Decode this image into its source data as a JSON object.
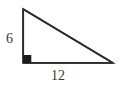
{
  "figure": {
    "type": "right-triangle-diagram",
    "background_color": "#ffffff",
    "stroke_color": "#2b2b2b",
    "label_color": "#3a3a3a",
    "stroke_width": 1.6,
    "canvas": {
      "width": 124,
      "height": 88
    },
    "vertices": {
      "apex": {
        "x": 23,
        "y": 9
      },
      "right_angle": {
        "x": 23,
        "y": 63
      },
      "right": {
        "x": 113,
        "y": 63
      }
    },
    "right_angle_marker": {
      "shape": "filled-square",
      "x": 23,
      "y": 55,
      "size": 8,
      "fill": "#1b1b1b"
    },
    "labels": {
      "vertical_leg": "6",
      "horizontal_leg": "12"
    }
  }
}
